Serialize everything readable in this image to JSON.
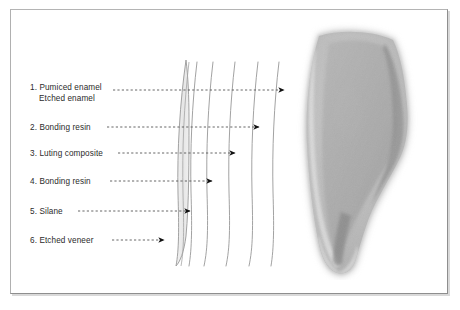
{
  "figure": {
    "border_color": "#a0a0a0",
    "background_color": "#ffffff",
    "text_color": "#2b2b2b",
    "leader_line_color": "#555555",
    "arrow_color": "#111111",
    "layer_line_color": "#9a9a9a",
    "veneer_fill_color": "#ececec"
  },
  "labels": [
    {
      "index": "1.",
      "text": "Pumiced enamel",
      "subtext": "Etched enamel",
      "x": 30,
      "y": 82,
      "leader_start_x": 113,
      "leader_y": 90,
      "arrow_x": 288
    },
    {
      "index": "2.",
      "text": "Bonding resin",
      "subtext": "",
      "x": 30,
      "y": 122,
      "leader_start_x": 107,
      "leader_y": 127,
      "arrow_x": 263
    },
    {
      "index": "3.",
      "text": "Luting composite",
      "subtext": "",
      "x": 30,
      "y": 148,
      "leader_start_x": 118,
      "leader_y": 153,
      "arrow_x": 239
    },
    {
      "index": "4.",
      "text": "Bonding resin",
      "subtext": "",
      "x": 30,
      "y": 176,
      "leader_start_x": 110,
      "leader_y": 181,
      "arrow_x": 216
    },
    {
      "index": "5.",
      "text": "Silane",
      "subtext": "",
      "x": 30,
      "y": 206,
      "leader_start_x": 78,
      "leader_y": 211,
      "arrow_x": 194
    },
    {
      "index": "6.",
      "text": "Etched veneer",
      "subtext": "",
      "x": 30,
      "y": 235,
      "leader_start_x": 112,
      "leader_y": 240,
      "arrow_x": 168
    }
  ],
  "layer_curves": [
    {
      "name": "veneer-sliver",
      "top_x": 184,
      "bottom_x": 179
    },
    {
      "name": "silane-line",
      "top_x": 196,
      "bottom_x": 190
    },
    {
      "name": "bonding-resin-inner-line",
      "top_x": 212,
      "bottom_x": 205
    },
    {
      "name": "luting-composite-line",
      "top_x": 233,
      "bottom_x": 226
    },
    {
      "name": "bonding-resin-outer-line",
      "top_x": 256,
      "bottom_x": 248
    },
    {
      "name": "etched-enamel-line",
      "top_x": 277,
      "bottom_x": 270
    }
  ],
  "tooth_image": {
    "name": "tooth-cross-section-micrograph",
    "description": "Grayscale micrograph of a tooth longitudinal cross-section",
    "x": 289,
    "y": 22,
    "width": 140,
    "height": 258
  }
}
